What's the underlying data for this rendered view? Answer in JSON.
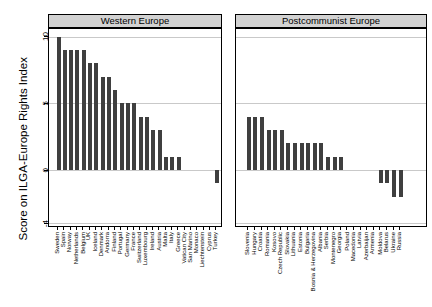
{
  "chart_data": {
    "type": "bar",
    "title": "",
    "ylabel": "Score on ILGA-Europe Rights Index",
    "xlabel": "",
    "ylim": [
      -4.3,
      10.6
    ],
    "yticks_labels": [
      "10",
      "5",
      "0",
      "-4"
    ],
    "yticks_values": [
      10,
      5,
      0,
      -4
    ],
    "grid": true,
    "legend": "none",
    "bar_color": "#3f3f3f",
    "strip_bg": "#d2d2d2",
    "grid_color": "#c9c9c9",
    "panels": [
      {
        "label": "Western Europe",
        "categories": [
          "Sweden",
          "Spain",
          "Norway",
          "Netherlands",
          "Belgium",
          "UK",
          "Iceland",
          "Denmark",
          "Andorra",
          "Finland",
          "Portugal",
          "Germany",
          "France",
          "Switzerland",
          "Luxembourg",
          "Ireland",
          "Austria",
          "Malta",
          "Italy",
          "Greece",
          "Vatican City",
          "San Marino",
          "Monaco",
          "Liechtenstein",
          "Cyprus",
          "Turkey"
        ],
        "values": [
          10,
          9,
          9,
          9,
          9,
          8,
          8,
          7,
          7,
          6,
          5,
          5,
          5,
          4,
          4,
          3,
          3,
          1,
          1,
          1,
          0,
          0,
          0,
          0,
          0,
          -1
        ]
      },
      {
        "label": "Postcommunist Europe",
        "categories": [
          "Slovenia",
          "Hungary",
          "Croatia",
          "Romania",
          "Kosovo",
          "Czech Republic",
          "Slovakia",
          "Lithuania",
          "Estonia",
          "Bulgaria",
          "Bosnia & Herzegovina",
          "Albania",
          "Serbia",
          "Montenegro",
          "Georgia",
          "Poland",
          "Macedonia",
          "Latvia",
          "Azerbaijan",
          "Armenia",
          "Moldova",
          "Belarus",
          "Ukraine",
          "Russia"
        ],
        "values": [
          4,
          4,
          4,
          3,
          3,
          3,
          2,
          2,
          2,
          2,
          2,
          2,
          1,
          1,
          1,
          0,
          0,
          0,
          0,
          0,
          -1,
          -1,
          -2,
          -2
        ]
      }
    ]
  }
}
